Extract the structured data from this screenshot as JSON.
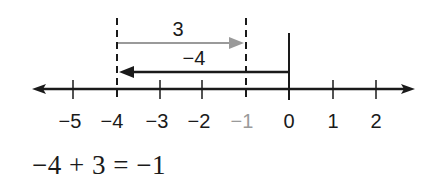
{
  "diagram": {
    "type": "number-line-addition",
    "number_line": {
      "ticks": [
        {
          "value": -5,
          "label": "−5",
          "x": 73,
          "highlight": false
        },
        {
          "value": -4,
          "label": "−4",
          "x": 117,
          "highlight": false
        },
        {
          "value": -3,
          "label": "−3",
          "x": 160,
          "highlight": false
        },
        {
          "value": -2,
          "label": "−2",
          "x": 202,
          "highlight": false
        },
        {
          "value": -1,
          "label": "−1",
          "x": 246,
          "highlight": true
        },
        {
          "value": 0,
          "label": "0",
          "x": 289,
          "highlight": false
        },
        {
          "value": 1,
          "label": "1",
          "x": 333,
          "highlight": false
        },
        {
          "value": 2,
          "label": "2",
          "x": 376,
          "highlight": false
        }
      ],
      "axis_color": "#1a1a1a",
      "highlight_color": "#9a9a9a"
    },
    "arrows": [
      {
        "name": "negative-four-arrow",
        "label": "−4",
        "from": 0,
        "to": -4,
        "color": "#1a1a1a"
      },
      {
        "name": "positive-three-arrow",
        "label": "3",
        "from": -4,
        "to": -1,
        "color": "#9a9a9a"
      }
    ],
    "equation": "−4 + 3 = −1"
  }
}
